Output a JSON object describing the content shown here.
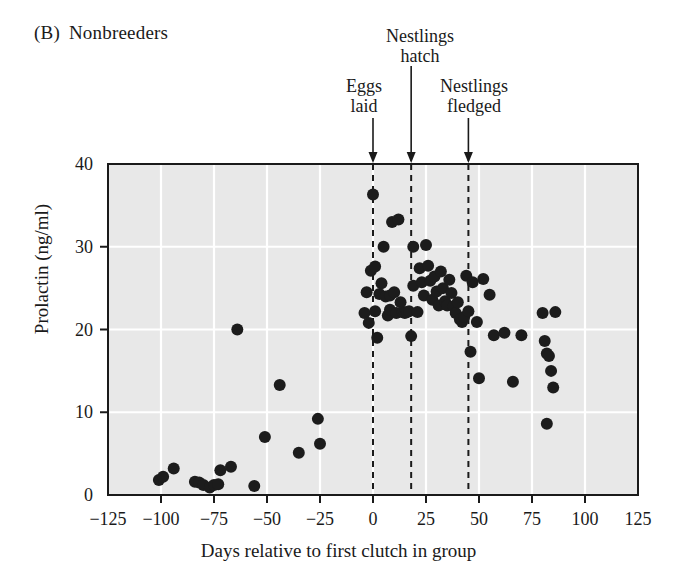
{
  "panel": {
    "tag": "(B)",
    "title": "Nonbreeders"
  },
  "annotations": [
    {
      "id": "hatch",
      "line1": "Nestlings",
      "line2": "hatch",
      "day": 18
    },
    {
      "id": "eggs",
      "line1": "Eggs",
      "line2": "laid",
      "day": 0
    },
    {
      "id": "fledge",
      "line1": "Nestlings",
      "line2": "fledged",
      "day": 45
    }
  ],
  "colors": {
    "plot_background": "#e8e8e8",
    "gridline": "#ffffff",
    "point": "#1c1c1c",
    "axis": "#1a1a1a",
    "text": "#1a1a1a"
  },
  "chart_data": {
    "type": "scatter",
    "xlabel": "Days relative to first clutch in group",
    "ylabel": "Prolactin (ng/ml)",
    "xlim": [
      -125,
      125
    ],
    "ylim": [
      0,
      40
    ],
    "xticks": [
      -125,
      -100,
      -75,
      -50,
      -25,
      0,
      25,
      50,
      75,
      100,
      125
    ],
    "xtick_labels": [
      "−125",
      "−100",
      "−75",
      "−50",
      "−25",
      "0",
      "25",
      "50",
      "75",
      "100",
      "125"
    ],
    "yticks": [
      0,
      10,
      20,
      30,
      40
    ],
    "ytick_labels": [
      "0",
      "10",
      "20",
      "30",
      "40"
    ],
    "grid": true,
    "grid_x": [
      -100,
      -75,
      -50,
      -25,
      0,
      25,
      50,
      75,
      100
    ],
    "grid_y": [
      10,
      20,
      30
    ],
    "legend": null,
    "marker": "filled-circle",
    "marker_size": 6,
    "vertical_reference_lines": [
      {
        "label": "Eggs laid",
        "x": 0,
        "style": "dashed"
      },
      {
        "label": "Nestlings hatch",
        "x": 18,
        "style": "dashed"
      },
      {
        "label": "Nestlings fledged",
        "x": 45,
        "style": "dashed"
      }
    ],
    "points": [
      [
        -101,
        1.8
      ],
      [
        -99,
        2.2
      ],
      [
        -94,
        3.2
      ],
      [
        -84,
        1.6
      ],
      [
        -82,
        1.5
      ],
      [
        -80,
        1.2
      ],
      [
        -77,
        0.9
      ],
      [
        -75,
        1.2
      ],
      [
        -73,
        1.3
      ],
      [
        -72,
        3.0
      ],
      [
        -67,
        3.4
      ],
      [
        -64,
        20.0
      ],
      [
        -56,
        1.1
      ],
      [
        -51,
        7.0
      ],
      [
        -44,
        13.3
      ],
      [
        -35,
        5.1
      ],
      [
        -26,
        9.2
      ],
      [
        -25,
        6.2
      ],
      [
        -4,
        22.0
      ],
      [
        -3,
        24.5
      ],
      [
        -2,
        20.8
      ],
      [
        -1,
        27.1
      ],
      [
        0,
        36.3
      ],
      [
        1,
        27.6
      ],
      [
        1,
        22.2
      ],
      [
        2,
        19.0
      ],
      [
        3,
        24.3
      ],
      [
        4,
        25.6
      ],
      [
        5,
        30.0
      ],
      [
        6,
        24.0
      ],
      [
        7,
        21.7
      ],
      [
        8,
        24.1
      ],
      [
        8,
        22.4
      ],
      [
        9,
        33.0
      ],
      [
        10,
        24.5
      ],
      [
        11,
        22.0
      ],
      [
        12,
        33.3
      ],
      [
        13,
        23.3
      ],
      [
        14,
        22.1
      ],
      [
        15,
        22.0
      ],
      [
        16,
        22.1
      ],
      [
        17,
        22.2
      ],
      [
        18,
        19.2
      ],
      [
        19,
        30.0
      ],
      [
        19,
        25.3
      ],
      [
        21,
        22.1
      ],
      [
        22,
        27.4
      ],
      [
        23,
        25.7
      ],
      [
        24,
        24.1
      ],
      [
        25,
        30.2
      ],
      [
        26,
        27.7
      ],
      [
        27,
        25.9
      ],
      [
        28,
        23.6
      ],
      [
        29,
        26.4
      ],
      [
        30,
        24.6
      ],
      [
        31,
        22.9
      ],
      [
        32,
        27.0
      ],
      [
        33,
        25.0
      ],
      [
        34,
        23.4
      ],
      [
        35,
        22.9
      ],
      [
        36,
        26.0
      ],
      [
        37,
        24.4
      ],
      [
        38,
        22.8
      ],
      [
        39,
        22.0
      ],
      [
        40,
        23.3
      ],
      [
        41,
        21.2
      ],
      [
        42,
        20.9
      ],
      [
        43,
        21.5
      ],
      [
        44,
        26.5
      ],
      [
        45,
        22.2
      ],
      [
        46,
        17.3
      ],
      [
        47,
        25.7
      ],
      [
        49,
        20.9
      ],
      [
        50,
        14.1
      ],
      [
        52,
        26.1
      ],
      [
        55,
        24.2
      ],
      [
        57,
        19.3
      ],
      [
        62,
        19.6
      ],
      [
        66,
        13.7
      ],
      [
        70,
        19.3
      ],
      [
        80,
        22.0
      ],
      [
        81,
        18.6
      ],
      [
        82,
        17.1
      ],
      [
        83,
        16.8
      ],
      [
        84,
        15.0
      ],
      [
        82,
        8.6
      ],
      [
        86,
        22.1
      ],
      [
        85,
        13.0
      ]
    ]
  }
}
